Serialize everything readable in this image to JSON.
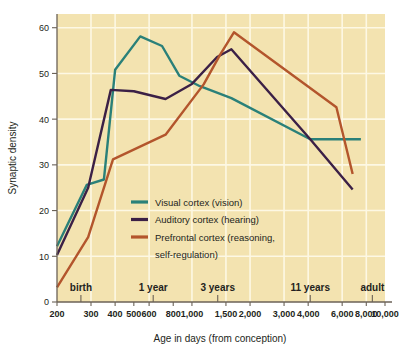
{
  "chart_data": {
    "type": "line",
    "title": "",
    "xlabel": "Age in days (from conception)",
    "ylabel": "Synaptic density",
    "xscale": "log",
    "xlim": [
      200,
      10000
    ],
    "ylim": [
      0,
      63
    ],
    "grid": true,
    "legend_position": "center-left-inside",
    "background_color": "#f3e3b0",
    "y_ticks": [
      0,
      10,
      20,
      30,
      40,
      50,
      60
    ],
    "y_tick_labels": [
      "0",
      "10",
      "20",
      "30",
      "40",
      "50",
      "60"
    ],
    "x_ticks": [
      200,
      300,
      400,
      500,
      600,
      800,
      1000,
      1500,
      2000,
      3000,
      4000,
      6000,
      8000,
      10000
    ],
    "x_tick_labels": [
      "200",
      "300",
      "400",
      "500",
      "600",
      "800",
      "1,000",
      "1,500",
      "2,000",
      "3,000",
      "4,000",
      "6,000",
      "8,000",
      "10,000"
    ],
    "annotations": [
      {
        "label": "birth",
        "x": 266
      },
      {
        "label": "1 year",
        "x": 630
      },
      {
        "label": "3 years",
        "x": 1360
      },
      {
        "label": "11 years",
        "x": 4100
      },
      {
        "label": "adult",
        "x": 8600
      }
    ],
    "series": [
      {
        "name": "Visual cortex (vision)",
        "color": "#2a8079",
        "points": [
          [
            200,
            12.2
          ],
          [
            285,
            25.6
          ],
          [
            350,
            26.8
          ],
          [
            400,
            50.8
          ],
          [
            540,
            58.1
          ],
          [
            700,
            56.0
          ],
          [
            860,
            49.5
          ],
          [
            1100,
            47.2
          ],
          [
            1600,
            44.6
          ],
          [
            4100,
            35.6
          ],
          [
            7500,
            35.6
          ]
        ]
      },
      {
        "name": "Auditory cortex (hearing)",
        "color": "#3b2046",
        "points": [
          [
            200,
            10.3
          ],
          [
            290,
            25.0
          ],
          [
            380,
            46.4
          ],
          [
            500,
            46.1
          ],
          [
            730,
            44.4
          ],
          [
            1000,
            47.7
          ],
          [
            1350,
            53.6
          ],
          [
            1600,
            55.3
          ],
          [
            4100,
            35.6
          ],
          [
            6800,
            24.6
          ]
        ]
      },
      {
        "name": "Prefrontal cortex (reasoning, self-regulation)",
        "color": "#b3552c",
        "points": [
          [
            200,
            3.2
          ],
          [
            290,
            14.2
          ],
          [
            390,
            31.2
          ],
          [
            730,
            36.6
          ],
          [
            1150,
            47.6
          ],
          [
            1400,
            54.1
          ],
          [
            1650,
            59.0
          ],
          [
            5600,
            42.6
          ],
          [
            6800,
            28.0
          ]
        ]
      }
    ]
  },
  "legend": {
    "entries": [
      {
        "label": "Visual cortex (vision)",
        "color": "#2a8079"
      },
      {
        "label": "Auditory cortex (hearing)",
        "color": "#3b2046"
      },
      {
        "label": "Prefrontal cortex (reasoning,",
        "color": "#b3552c"
      }
    ],
    "continuation_line": "self-regulation)"
  }
}
